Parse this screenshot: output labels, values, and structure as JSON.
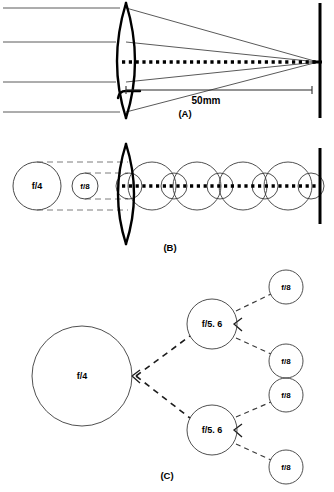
{
  "figure": {
    "background_color": "#ffffff",
    "ink_color": "#000000",
    "ray_color": "#5a5a5a"
  },
  "panels": [
    {
      "id": "A",
      "label": "(A)",
      "label_x": 185,
      "label_y": 115,
      "description": "Biconvex lens focusing four parallel rays onto the film plane",
      "measurement": {
        "text": "50mm",
        "x": 206,
        "y": 103,
        "line_y": 90,
        "line_x1": 126,
        "line_x2": 310
      },
      "lens": {
        "center_x": 126,
        "top_y": 3,
        "bottom_y": 118,
        "bulge": 16
      },
      "optical_axis_y": 62,
      "film_plane_x": 320,
      "rays_y": [
        8,
        42,
        82,
        112
      ],
      "ray_start_x": 3,
      "focus_x": 318
    },
    {
      "id": "B",
      "label": "(B)",
      "label_x": 170,
      "label_y": 248,
      "description": "Aperture circles f/4 and f/8 compared, with circles of confusion along the optical axis",
      "optical_axis_y": 186,
      "film_plane_x": 320,
      "lens": {
        "center_x": 126,
        "top_y": 144,
        "bottom_y": 244,
        "bulge": 15
      },
      "aperture_circles": [
        {
          "name": "f/4",
          "cx": 37,
          "cy": 186,
          "r": 24
        },
        {
          "name": "f/8",
          "cx": 85,
          "cy": 186,
          "r": 13
        }
      ],
      "guides_y": [
        162,
        210,
        173,
        199
      ],
      "confusion_circles": [
        {
          "cx": 129,
          "cy": 186,
          "r": 13
        },
        {
          "cx": 152,
          "cy": 186,
          "r": 24
        },
        {
          "cx": 174,
          "cy": 186,
          "r": 13
        },
        {
          "cx": 197,
          "cy": 186,
          "r": 24
        },
        {
          "cx": 220,
          "cy": 186,
          "r": 13
        },
        {
          "cx": 243,
          "cy": 186,
          "r": 24
        },
        {
          "cx": 265,
          "cy": 186,
          "r": 13
        },
        {
          "cx": 288,
          "cy": 186,
          "r": 24
        },
        {
          "cx": 311,
          "cy": 186,
          "r": 13
        }
      ]
    },
    {
      "id": "C",
      "label": "(C)",
      "label_x": 167,
      "label_y": 476,
      "description": "Branching tree showing one f/4 aperture splitting into two f/5.6 then four f/8",
      "nodes": [
        {
          "name": "f/4",
          "cx": 82,
          "cy": 376,
          "r": 50,
          "size": "large"
        },
        {
          "name": "f/5. 6",
          "cx": 212,
          "cy": 324,
          "r": 25,
          "size": "medium"
        },
        {
          "name": "f/5. 6",
          "cx": 212,
          "cy": 430,
          "r": 25,
          "size": "medium"
        },
        {
          "name": "f/8",
          "cx": 286,
          "cy": 287,
          "r": 17,
          "size": "small"
        },
        {
          "name": "f/8",
          "cx": 286,
          "cy": 361,
          "r": 17,
          "size": "small"
        },
        {
          "name": "f/8",
          "cx": 286,
          "cy": 395,
          "r": 17,
          "size": "small"
        },
        {
          "name": "f/8",
          "cx": 286,
          "cy": 467,
          "r": 17,
          "size": "small"
        }
      ],
      "branches": [
        {
          "x1": 136,
          "y1": 376,
          "x2": 190,
          "y2": 336,
          "weight": "thick"
        },
        {
          "x1": 136,
          "y1": 376,
          "x2": 190,
          "y2": 418,
          "weight": "thick"
        },
        {
          "x1": 236,
          "y1": 310,
          "x2": 271,
          "y2": 295,
          "weight": "thin"
        },
        {
          "x1": 236,
          "y1": 338,
          "x2": 271,
          "y2": 354,
          "weight": "thin"
        },
        {
          "x1": 236,
          "y1": 418,
          "x2": 271,
          "y2": 402,
          "weight": "thin"
        },
        {
          "x1": 236,
          "y1": 444,
          "x2": 271,
          "y2": 459,
          "weight": "thin"
        }
      ],
      "arrow_marks": [
        {
          "x": 134,
          "y": 376
        },
        {
          "x": 236,
          "y": 324
        },
        {
          "x": 236,
          "y": 430
        }
      ]
    }
  ],
  "labels": {
    "f4": "f/4",
    "f8": "f/8",
    "f56": "f/5. 6",
    "measurement_50mm": "50mm",
    "panel_a": "(A)",
    "panel_b": "(B)",
    "panel_c": "(C)"
  }
}
